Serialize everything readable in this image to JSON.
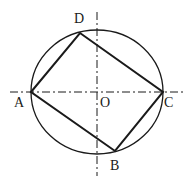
{
  "diagram": {
    "stroke_color": "#1a1a1a",
    "background": "#ffffff",
    "circle": {
      "label": "O",
      "cx": 97,
      "cy": 92,
      "rx": 66,
      "ry": 62
    },
    "axes": {
      "horizontal": {
        "x1": 10,
        "y1": 92,
        "x2": 183,
        "y2": 92,
        "style": "dash-dot"
      },
      "vertical": {
        "x1": 97,
        "y1": 12,
        "x2": 97,
        "y2": 176,
        "style": "dash-dot"
      }
    },
    "points": [
      {
        "name": "A",
        "x": 31,
        "y": 92,
        "label_x": 14,
        "label_y": 107
      },
      {
        "name": "D",
        "x": 80,
        "y": 33,
        "label_x": 74,
        "label_y": 23
      },
      {
        "name": "C",
        "x": 163,
        "y": 92,
        "label_x": 164,
        "label_y": 107
      },
      {
        "name": "B",
        "x": 115,
        "y": 151,
        "label_x": 110,
        "label_y": 170
      },
      {
        "name": "O",
        "x": 97,
        "y": 92,
        "label_x": 100,
        "label_y": 107
      }
    ],
    "polygon": [
      "A",
      "D",
      "C",
      "B"
    ]
  }
}
